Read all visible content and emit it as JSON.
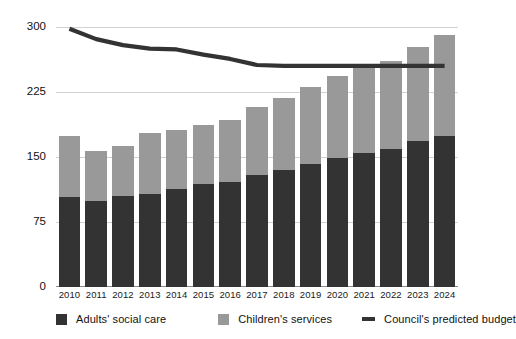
{
  "chart_data": {
    "type": "bar",
    "title": "",
    "subtitle": "",
    "xlabel": "",
    "ylabel": "",
    "categories": [
      "2010",
      "2011",
      "2012",
      "2013",
      "2014",
      "2015",
      "2016",
      "2017",
      "2018",
      "2019",
      "2020",
      "2021",
      "2022",
      "2023",
      "2024"
    ],
    "ylim": [
      0,
      300
    ],
    "yticks": [
      0,
      75,
      150,
      225,
      300
    ],
    "ytick_labels": [
      "0",
      "75",
      "150",
      "225",
      "300"
    ],
    "grid": true,
    "stacked": true,
    "legend_position": "bottom",
    "series": [
      {
        "name": "Adults' social care",
        "type": "bar",
        "color": "#333333",
        "values": [
          104,
          100,
          105,
          108,
          114,
          119,
          122,
          130,
          136,
          143,
          150,
          155,
          160,
          169,
          175
        ]
      },
      {
        "name": "Children's services",
        "type": "bar",
        "color": "#999999",
        "values": [
          71,
          58,
          58,
          70,
          68,
          69,
          72,
          78,
          83,
          89,
          94,
          100,
          102,
          109,
          117
        ]
      },
      {
        "name": "Council's predicted budget",
        "type": "line",
        "color": "#333333",
        "values": [
          298,
          286,
          279,
          275,
          274,
          268,
          263,
          256,
          255,
          255,
          255,
          255,
          255,
          255,
          255
        ]
      }
    ],
    "stack_totals": [
      175,
      158,
      163,
      178,
      182,
      188,
      194,
      208,
      219,
      232,
      244,
      255,
      262,
      278,
      292
    ]
  },
  "legend": {
    "items": [
      {
        "label": "Adults' social care",
        "marker": "square-swatch",
        "color": "#333333"
      },
      {
        "label": "Children's services",
        "marker": "square-swatch",
        "color": "#999999"
      },
      {
        "label": "Council's predicted budget",
        "marker": "line-swatch",
        "color": "#333333"
      }
    ]
  },
  "colors": {
    "adults": "#333333",
    "children": "#999999",
    "budget_line": "#333333",
    "gridline": "#d2d2d2",
    "axis": "#8a8a8a",
    "background": "#ffffff",
    "text": "#111111"
  }
}
